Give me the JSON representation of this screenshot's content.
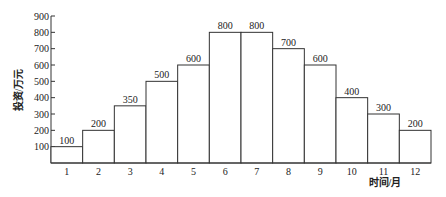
{
  "chart_data": {
    "type": "bar",
    "title": "",
    "xlabel": "时间/月",
    "ylabel": "投资/万元",
    "categories": [
      "1",
      "2",
      "3",
      "4",
      "5",
      "6",
      "7",
      "8",
      "9",
      "10",
      "11",
      "12"
    ],
    "values": [
      100,
      200,
      350,
      500,
      600,
      800,
      800,
      700,
      600,
      400,
      300,
      200
    ],
    "yticks": [
      100,
      200,
      300,
      400,
      500,
      600,
      700,
      800,
      900
    ],
    "ylim": [
      0,
      900
    ],
    "grid": false,
    "legend": null,
    "data_labels": true,
    "bar_gap": 0
  },
  "colors": {
    "bar_fill": "#ffffff",
    "bar_stroke": "#333333",
    "text": "#222222"
  }
}
